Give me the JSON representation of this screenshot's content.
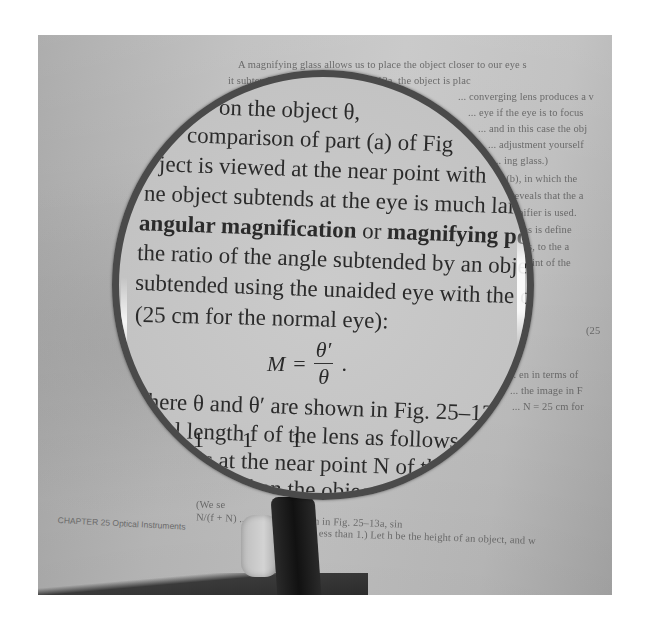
{
  "scene": {
    "description": "Photograph of a hand holding a magnifying glass over a physics textbook page",
    "colors": {
      "paper": "#c0c0c0",
      "ink": "#2b2b2b",
      "lens_rim": "#4a4a4a",
      "handle": "#1a1a1a"
    }
  },
  "page": {
    "background_lines": [
      "A magnifying glass allows us to place the object closer to our eye s",
      "it subtends ... as shown in Fig. 25–13a, the object is plac",
      "... converging lens produces a v",
      "... eye if the eye is to focus",
      "... and in this case the obj",
      "... adjustment yourself",
      "... ing glass.)",
      "...(b), in which the",
      "... reveals that the a",
      "... gnifier is used.",
      "... lens is define",
      "... lens, to the a",
      "... r point of the"
    ],
    "equation_number": "(25",
    "right_lines_lower": [
      "... en in terms of",
      "... the image in F",
      "... N = 25 cm for"
    ],
    "bottom_lines": [
      "(We se",
      "N/(f + N) ... d₀ < f, as shown in Fig. 25–13a, sin",
      "... ess than 1.) Let h be the height of an object, and w"
    ],
    "footer": "CHAPTER 25   Optical Instruments"
  },
  "magnified": {
    "lines": [
      "on the object θ,",
      "comparison of part (a) of Fig",
      "ject is viewed at the near point with",
      "ne object subtends at the eye is much lar",
      "the ratio of the angle subtended by an object",
      "subtended using the unaided eye with the ob",
      "(25 cm for the normal eye):"
    ],
    "bold_line": {
      "term1": "angular magnification",
      "connector": " or ",
      "term2": "magnifying po"
    },
    "formula": {
      "lhs": "M",
      "eq": "=",
      "numerator": "θ′",
      "denominator": "θ",
      "trailing": "."
    },
    "lines_after": [
      "where θ and θ′ are shown in Fig. 25–13. T",
      "focal length f of the lens as follows. Su",
      "–13a is at the near point N of the eye",
      "al eye. Then the object distanc"
    ],
    "ticks": [
      "1",
      "1",
      "1"
    ]
  }
}
